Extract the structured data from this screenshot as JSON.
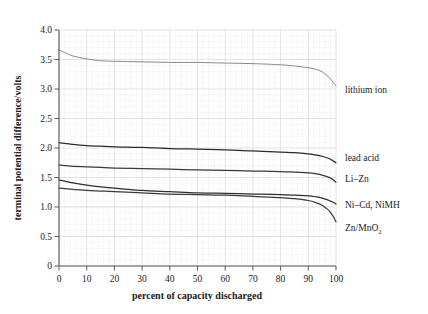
{
  "chart_data": {
    "type": "line",
    "title": "",
    "xlabel": "percent of capacity discharged",
    "ylabel": "terminal potential difference/volts",
    "xlim": [
      0,
      100
    ],
    "ylim": [
      0,
      4.0
    ],
    "xticks": [
      "0",
      "10",
      "20",
      "30",
      "40",
      "50",
      "60",
      "70",
      "80",
      "90",
      "100"
    ],
    "xtick_values": [
      0,
      10,
      20,
      30,
      40,
      50,
      60,
      70,
      80,
      90,
      100
    ],
    "yticks": [
      "0",
      "0.5",
      "1.0",
      "1.5",
      "2.0",
      "2.5",
      "3.0",
      "3.5",
      "4.0"
    ],
    "ytick_values": [
      0,
      0.5,
      1.0,
      1.5,
      2.0,
      2.5,
      3.0,
      3.5,
      4.0
    ],
    "grid": true,
    "grid_minor": true,
    "legend": "right-inline-labels",
    "x": [
      0,
      2,
      5,
      10,
      15,
      20,
      30,
      40,
      50,
      60,
      70,
      80,
      85,
      90,
      93,
      95,
      97,
      98,
      99,
      100
    ],
    "series": [
      {
        "name": "lithium ion",
        "label": "lithium ion",
        "color": "#8a8a8a",
        "label_x": 345,
        "label_y": 93,
        "values": [
          3.66,
          3.62,
          3.56,
          3.51,
          3.48,
          3.47,
          3.46,
          3.45,
          3.45,
          3.44,
          3.43,
          3.41,
          3.39,
          3.36,
          3.33,
          3.29,
          3.22,
          3.17,
          3.11,
          3.05
        ]
      },
      {
        "name": "lead acid",
        "label": "lead acid",
        "color": "#2a2a2a",
        "label_x": 345,
        "label_y": 161,
        "values": [
          2.09,
          2.08,
          2.06,
          2.04,
          2.03,
          2.02,
          2.01,
          1.99,
          1.98,
          1.97,
          1.95,
          1.93,
          1.92,
          1.9,
          1.88,
          1.86,
          1.83,
          1.81,
          1.78,
          1.75
        ]
      },
      {
        "name": "Li-Zn",
        "label": "Li–Zn",
        "color": "#3a3a3a",
        "label_x": 345,
        "label_y": 182,
        "values": [
          1.71,
          1.7,
          1.69,
          1.68,
          1.67,
          1.66,
          1.65,
          1.64,
          1.63,
          1.62,
          1.61,
          1.6,
          1.59,
          1.58,
          1.56,
          1.54,
          1.51,
          1.49,
          1.46,
          1.42
        ]
      },
      {
        "name": "Ni-Cd, NiMH",
        "label": "Ni–Cd, NiMH",
        "color": "#2e2e2e",
        "label_x": 345,
        "label_y": 208,
        "values": [
          1.46,
          1.44,
          1.41,
          1.37,
          1.34,
          1.32,
          1.28,
          1.26,
          1.24,
          1.23,
          1.22,
          1.21,
          1.2,
          1.19,
          1.17,
          1.15,
          1.12,
          1.1,
          1.08,
          1.05
        ]
      },
      {
        "name": "Zn/MnO2",
        "label": "Zn/MnO",
        "label_sub": "2",
        "color": "#3a3a3a",
        "label_x": 345,
        "label_y": 231,
        "values": [
          1.32,
          1.31,
          1.3,
          1.28,
          1.27,
          1.26,
          1.24,
          1.22,
          1.21,
          1.2,
          1.18,
          1.16,
          1.14,
          1.11,
          1.07,
          1.03,
          0.96,
          0.91,
          0.84,
          0.75
        ]
      }
    ]
  },
  "plot_box": {
    "left": 59,
    "right": 336,
    "top": 30,
    "bottom": 266
  }
}
